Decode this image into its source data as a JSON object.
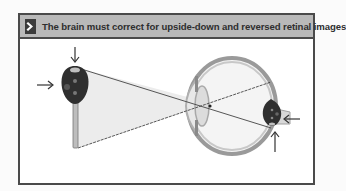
{
  "header": {
    "icon": "chevron-right-icon",
    "title": "The brain must correct for upside-down and reversed retinal images"
  },
  "diagram": {
    "object": "car-key",
    "object_arrows": [
      "down-arrow (above key)",
      "right-arrow (left of key)"
    ],
    "organ": "eyeball cross-section",
    "retinal_image": "inverted car-key",
    "retinal_arrows": [
      "left-arrow (right of image)",
      "up-arrow (below image)"
    ],
    "colors": {
      "frame": "#4a4a4a",
      "header_bg": "#b9b9b9",
      "icon_bg": "#3b3b3b",
      "ray_fill": "#ececec",
      "key": "#2f2f2f"
    }
  }
}
